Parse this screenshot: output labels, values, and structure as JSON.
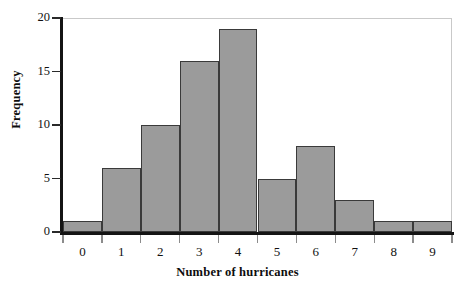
{
  "chart_data": {
    "type": "bar",
    "title": "",
    "subtitle": "",
    "xlabel": "Number of hurricanes",
    "ylabel": "Frequency",
    "categories": [
      "0",
      "1",
      "2",
      "3",
      "4",
      "5",
      "6",
      "7",
      "8",
      "9"
    ],
    "values": [
      1,
      6,
      10,
      16,
      19,
      5,
      8,
      3,
      1,
      1
    ],
    "series": [
      {
        "name": "Frequency",
        "values": [
          1,
          6,
          10,
          16,
          19,
          5,
          8,
          3,
          1,
          1
        ]
      }
    ],
    "xlim": [
      -0.5,
      9.5
    ],
    "ylim": [
      0,
      20
    ],
    "ytick_labels": [
      "0",
      "5",
      "10",
      "15",
      "20"
    ],
    "ytick_values": [
      0,
      5,
      10,
      15,
      20
    ],
    "xtick_labels": [
      "0",
      "1",
      "2",
      "3",
      "4",
      "5",
      "6",
      "7",
      "8",
      "9"
    ],
    "bin_edges": [
      -0.5,
      0.5,
      1.5,
      2.5,
      3.5,
      4.5,
      5.5,
      6.5,
      7.5,
      8.5,
      9.5
    ],
    "grid": false,
    "legend": false,
    "legend_position": "none",
    "annotations": [],
    "colors": {
      "bar_fill": "#9b9b9b",
      "bar_edge": "#3a3a3a",
      "axis": "#141414",
      "frame": "#c9c9c9",
      "text": "#111111",
      "background": "#ffffff"
    }
  }
}
